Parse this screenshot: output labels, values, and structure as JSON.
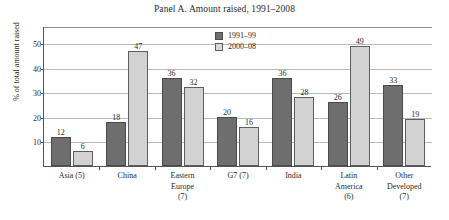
{
  "chart_data": {
    "type": "bar",
    "title": "Panel A. Amount raised, 1991–2008",
    "xlabel": "",
    "ylabel": "% of total amount raised",
    "ylim": [
      0,
      57
    ],
    "yticks": [
      10,
      20,
      30,
      40,
      50
    ],
    "grid": true,
    "legend_position": "top-center",
    "categories": [
      "Asia (5)",
      "China",
      "Eastern\nEurope\n(7)",
      "G7 (7)",
      "India",
      "Latin\nAmerica\n(6)",
      "Other\nDeveloped\n(7)"
    ],
    "series": [
      {
        "name": "1991–99",
        "color": "#6e6e6e",
        "values": [
          12,
          18,
          36,
          20,
          36,
          26,
          33
        ]
      },
      {
        "name": "2000–08",
        "color": "#d2d2d2",
        "values": [
          6,
          47,
          32,
          16,
          28,
          49,
          19
        ]
      }
    ]
  }
}
